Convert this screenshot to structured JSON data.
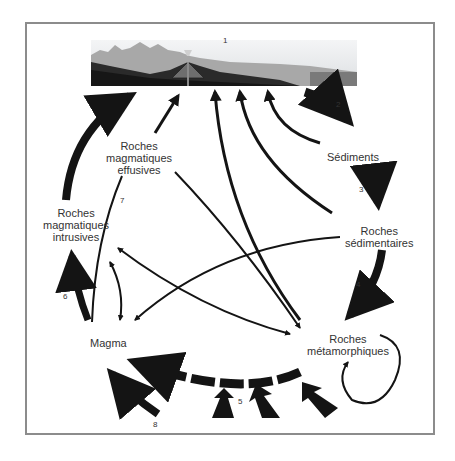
{
  "diagram": {
    "nodes": [
      {
        "id": "surface",
        "label": "1",
        "type": "block-diagram"
      },
      {
        "id": "sediments",
        "label": "Sédiments"
      },
      {
        "id": "roches_sedimentaires",
        "label_line1": "Roches",
        "label_line2": "sédimentaires"
      },
      {
        "id": "roches_metamorphiques",
        "label_line1": "Roches",
        "label_line2": "métamorphiques"
      },
      {
        "id": "magma",
        "label": "Magma"
      },
      {
        "id": "roches_magmatiques_intrusives",
        "label_line1": "Roches",
        "label_line2": "magmatiques",
        "label_line3": "intrusives"
      },
      {
        "id": "roches_magmatiques_effusives",
        "label_line1": "Roches",
        "label_line2": "magmatiques",
        "label_line3": "effusives"
      }
    ],
    "process_numbers": [
      "1",
      "2",
      "3",
      "4",
      "5",
      "6",
      "7",
      "8"
    ],
    "edges": [
      {
        "from": "surface",
        "to": "sediments",
        "label": "2",
        "weight": "thick"
      },
      {
        "from": "sediments",
        "to": "roches_sedimentaires",
        "label": "3",
        "weight": "thick"
      },
      {
        "from": "roches_sedimentaires",
        "to": "roches_metamorphiques",
        "label": "4",
        "weight": "thick"
      },
      {
        "from": "roches_metamorphiques",
        "to": "magma",
        "label": "5",
        "weight": "thick-dashed"
      },
      {
        "from": "magma",
        "to": "roches_magmatiques_intrusives",
        "label": "6",
        "weight": "thick"
      },
      {
        "from": "magma",
        "to": "roches_magmatiques_effusives",
        "label": "7",
        "weight": "thin"
      },
      {
        "from": "external",
        "to": "magma",
        "label": "8",
        "weight": "thick"
      },
      {
        "from": "roches_magmatiques_intrusives",
        "to": "surface",
        "weight": "thick"
      },
      {
        "from": "roches_magmatiques_effusives",
        "to": "surface",
        "weight": "medium"
      },
      {
        "from": "roches_metamorphiques",
        "to": "surface",
        "weight": "thin"
      },
      {
        "from": "roches_sedimentaires",
        "to": "surface",
        "weight": "thin"
      },
      {
        "from": "sediments",
        "to": "surface",
        "weight": "thin"
      },
      {
        "from": "roches_magmatiques_effusives",
        "to": "roches_metamorphiques",
        "weight": "thin"
      },
      {
        "from": "roches_sedimentaires",
        "to": "magma",
        "weight": "thin"
      },
      {
        "from": "roches_metamorphiques",
        "to": "roches_magmatiques_intrusives",
        "weight": "thin",
        "bidirectional": true
      },
      {
        "from": "magma",
        "to": "roches_magmatiques_intrusives",
        "weight": "thin",
        "bidirectional": true
      },
      {
        "from": "roches_metamorphiques",
        "to": "roches_metamorphiques",
        "weight": "thin",
        "loop": true
      },
      {
        "from": "external",
        "to": "roches_metamorphiques",
        "label": "5",
        "weight": "thick",
        "count": 3
      }
    ],
    "colors": {
      "arrow": "#141414",
      "text": "#333333",
      "frame": "#8c8c8c",
      "sky": "#e6e8ea",
      "mountain": "#9a9a9a",
      "rock_dark": "#1e1e1e",
      "sea": "#8a8a8a"
    }
  }
}
